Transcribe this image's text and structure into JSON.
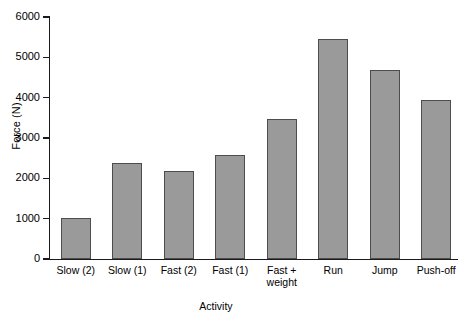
{
  "chart_data": {
    "type": "bar",
    "title": "",
    "xlabel": "Activity",
    "ylabel": "Force (N)",
    "categories": [
      "Slow (2)",
      "Slow (1)",
      "Fast (2)",
      "Fast (1)",
      "Fast +\nweight",
      "Run",
      "Jump",
      "Push-off"
    ],
    "values": [
      1010,
      2390,
      2190,
      2580,
      3470,
      5460,
      4680,
      3950
    ],
    "ylim": [
      0,
      6000
    ],
    "yticks": [
      0,
      1000,
      2000,
      3000,
      4000,
      5000,
      6000
    ],
    "ytick_labels": [
      "0",
      "1000",
      "2000",
      "3000",
      "4000",
      "5000",
      "6000"
    ],
    "grid": false,
    "legend": null,
    "bar_fill_color": "#9a9a9a",
    "bar_edge_color": "#4d4d4d",
    "axis_color": "#1a1a1a",
    "background_color": "#ffffff"
  }
}
